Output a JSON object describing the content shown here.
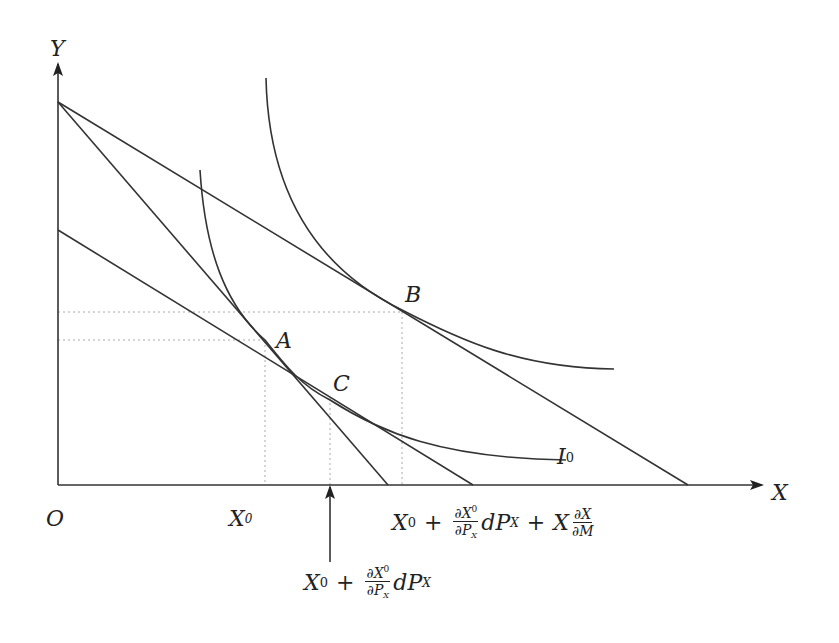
{
  "diagram": {
    "type": "economics-indifference-curve-diagram",
    "axes": {
      "y_label": "Y",
      "x_label": "X",
      "origin_label": "O"
    },
    "points": {
      "A": "A",
      "B": "B",
      "C": "C"
    },
    "curve_labels": {
      "I0": {
        "base": "I",
        "sup": "0"
      }
    },
    "x_ticks": {
      "x0": {
        "base": "X",
        "sub": "0"
      }
    },
    "annotations": {
      "substitution": {
        "base": "X",
        "sup": "0",
        "plus": "+",
        "frac_num_base": "∂X",
        "frac_num_sup": "0",
        "frac_den_base": "∂P",
        "frac_den_sub": "X",
        "tail_base": "dP",
        "tail_sub": "X"
      },
      "total": {
        "base": "X",
        "sup": "0",
        "plus": "+",
        "frac_num_base": "∂X",
        "frac_num_sup": "0",
        "frac_den_base": "∂P",
        "frac_den_sub": "X",
        "tail_base": "dP",
        "tail_sub": "X",
        "plus2": "+",
        "term2_base": "X",
        "frac2_num": "∂X",
        "frac2_den": "∂M"
      }
    },
    "colors": {
      "line": "#333333",
      "dotted": "#aaaaaa",
      "text": "#222222"
    }
  }
}
